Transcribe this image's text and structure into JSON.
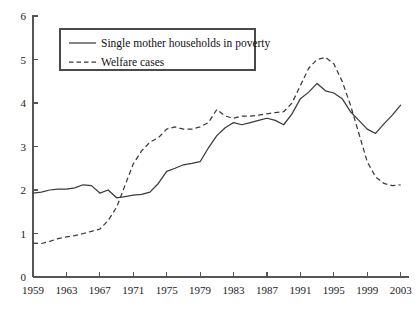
{
  "chart_data": {
    "type": "line",
    "title": "",
    "xlabel": "",
    "ylabel": "",
    "xlim": [
      1959,
      2004
    ],
    "ylim": [
      0,
      6
    ],
    "grid": false,
    "legend_position": "top-left-inside",
    "x_ticks": [
      "1959",
      "1963",
      "1967",
      "1971",
      "1975",
      "1979",
      "1983",
      "1987",
      "1991",
      "1995",
      "1999",
      "2003"
    ],
    "y_ticks": [
      "0",
      "1",
      "2",
      "3",
      "4",
      "5",
      "6"
    ],
    "x": [
      1959,
      1960,
      1961,
      1962,
      1963,
      1964,
      1965,
      1966,
      1967,
      1968,
      1969,
      1970,
      1971,
      1972,
      1973,
      1974,
      1975,
      1976,
      1977,
      1978,
      1979,
      1980,
      1981,
      1982,
      1983,
      1984,
      1985,
      1986,
      1987,
      1988,
      1989,
      1990,
      1991,
      1992,
      1993,
      1994,
      1995,
      1996,
      1997,
      1998,
      1999,
      2000,
      2001,
      2002,
      2003
    ],
    "series": [
      {
        "name": "Single mother households in poverty",
        "style": "solid",
        "color": "#3a3a3a",
        "values": [
          1.93,
          1.95,
          2.0,
          2.02,
          2.02,
          2.05,
          2.12,
          2.1,
          1.93,
          2.0,
          1.82,
          1.85,
          1.88,
          1.9,
          1.95,
          2.15,
          2.43,
          2.5,
          2.58,
          2.61,
          2.65,
          2.97,
          3.25,
          3.43,
          3.55,
          3.5,
          3.55,
          3.6,
          3.65,
          3.6,
          3.5,
          3.75,
          4.1,
          4.25,
          4.45,
          4.28,
          4.23,
          4.1,
          3.8,
          3.6,
          3.4,
          3.3,
          3.52,
          3.72,
          3.95
        ]
      },
      {
        "name": "Welfare cases",
        "style": "dashed",
        "color": "#3a3a3a",
        "values": [
          0.78,
          0.77,
          0.82,
          0.88,
          0.92,
          0.95,
          1.0,
          1.05,
          1.1,
          1.3,
          1.6,
          2.1,
          2.6,
          2.9,
          3.1,
          3.2,
          3.4,
          3.45,
          3.4,
          3.4,
          3.45,
          3.55,
          3.85,
          3.7,
          3.65,
          3.7,
          3.7,
          3.72,
          3.75,
          3.78,
          3.8,
          4.0,
          4.4,
          4.8,
          5.0,
          5.05,
          4.9,
          4.5,
          3.95,
          3.3,
          2.65,
          2.3,
          2.15,
          2.1,
          2.12
        ]
      }
    ],
    "legend": [
      {
        "label": "Single mother households in poverty",
        "style": "solid"
      },
      {
        "label": "Welfare cases",
        "style": "dashed"
      }
    ]
  }
}
